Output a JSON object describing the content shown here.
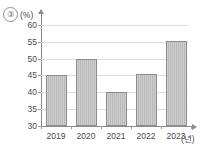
{
  "figure": {
    "item_number": "③",
    "y_unit": "(%)",
    "x_unit": "(년)"
  },
  "chart_data": {
    "type": "bar",
    "title": "",
    "xlabel": "(년)",
    "ylabel": "(%)",
    "categories": [
      "2019",
      "2020",
      "2021",
      "2022",
      "2023"
    ],
    "values": [
      45,
      50,
      40,
      45.3,
      55.3
    ],
    "ylim": [
      30,
      62
    ],
    "yticks": [
      30,
      35,
      40,
      45,
      50,
      55,
      60
    ],
    "ytick_labels": [
      "30",
      "35",
      "40",
      "45",
      "50",
      "55",
      "60"
    ],
    "grid": true,
    "legend": false,
    "bar_color": "#b9b9b9",
    "bar_edge_color": "#8c8c8c",
    "grid_color": "#dedede",
    "axis_color": "#8a8a8a"
  }
}
